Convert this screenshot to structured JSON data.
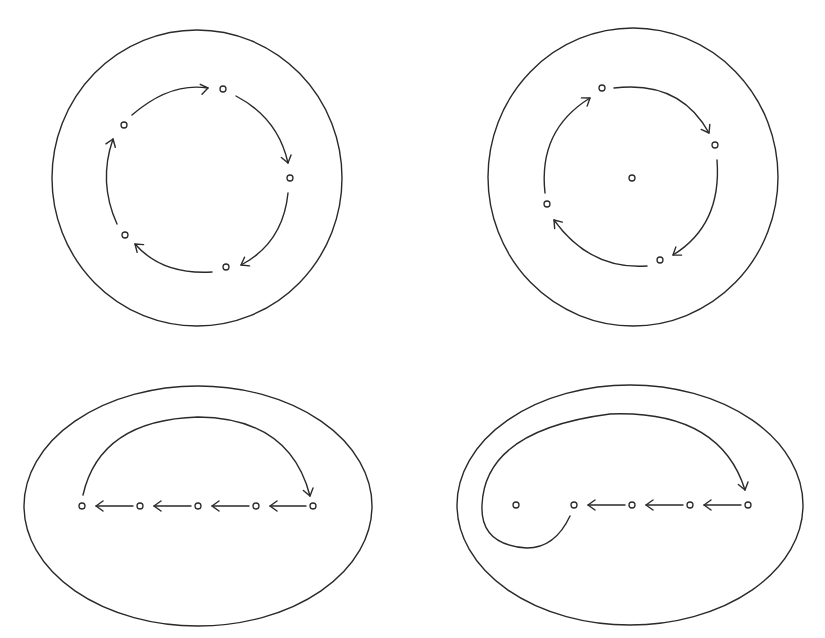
{
  "diagram": {
    "stroke_color": "#2a2a2a",
    "background": "#ffffff",
    "panels": [
      {
        "id": "top-left",
        "boundary": {
          "shape": "circle",
          "cx": 197,
          "cy": 178,
          "rx": 145,
          "ry": 148
        },
        "points": [
          [
            223,
            89
          ],
          [
            290,
            178
          ],
          [
            226,
            267
          ],
          [
            125,
            235
          ],
          [
            124,
            125
          ]
        ],
        "orbit": "periodic 5-cycle, clockwise",
        "arrows": [
          {
            "d": "M132 115 Q170 82 208 88",
            "head": [
              208,
              88,
              -10
            ]
          },
          {
            "d": "M236 96 Q278 118 288 163",
            "head": [
              288,
              163,
              75
            ]
          },
          {
            "d": "M288 193 Q283 243 241 265",
            "head": [
              241,
              265,
              150
            ]
          },
          {
            "d": "M212 272 Q162 275 135 244",
            "head": [
              135,
              244,
              220
            ]
          },
          {
            "d": "M117 224 Q98 182 113 139",
            "head": [
              113,
              139,
              -70
            ]
          }
        ]
      },
      {
        "id": "top-right",
        "boundary": {
          "shape": "circle",
          "cx": 633,
          "cy": 177,
          "rx": 145,
          "ry": 149
        },
        "points": [
          [
            602,
            88
          ],
          [
            715,
            145
          ],
          [
            660,
            260
          ],
          [
            547,
            204
          ],
          [
            632,
            178
          ]
        ],
        "orbit": "periodic 4-cycle around a fixed center point",
        "arrows": [
          {
            "d": "M614 88 Q680 80 709 133",
            "head": [
              709,
              133,
              60
            ]
          },
          {
            "d": "M717 160 Q722 225 673 255",
            "head": [
              673,
              255,
              145
            ]
          },
          {
            "d": "M647 266 Q590 270 554 220",
            "head": [
              554,
              220,
              230
            ]
          },
          {
            "d": "M545 193 Q538 130 590 98",
            "head": [
              590,
              98,
              -35
            ]
          }
        ]
      },
      {
        "id": "bottom-left",
        "boundary": {
          "shape": "ellipse",
          "cx": 198,
          "cy": 506,
          "rx": 174,
          "ry": 120
        },
        "points": [
          [
            82,
            506
          ],
          [
            140,
            506
          ],
          [
            198,
            506
          ],
          [
            256,
            506
          ],
          [
            313,
            506
          ]
        ],
        "orbit": "points marching left, then jumping back right",
        "arrows": [
          {
            "d": "M133 506 L96 506",
            "head": [
              96,
              506,
              180
            ]
          },
          {
            "d": "M191 506 L154 506",
            "head": [
              154,
              506,
              180
            ]
          },
          {
            "d": "M249 506 L212 506",
            "head": [
              212,
              506,
              180
            ]
          },
          {
            "d": "M306 506 L270 506",
            "head": [
              270,
              506,
              180
            ]
          },
          {
            "d": "M83 495 Q100 420 198 417 Q290 418 310 496",
            "head": [
              310,
              496,
              75
            ]
          }
        ]
      },
      {
        "id": "bottom-right",
        "boundary": {
          "shape": "ellipse",
          "cx": 630,
          "cy": 505,
          "rx": 173,
          "ry": 120
        },
        "points": [
          [
            516,
            505
          ],
          [
            574,
            505
          ],
          [
            632,
            505
          ],
          [
            690,
            505
          ],
          [
            748,
            505
          ]
        ],
        "orbit": "points marching left, curve wraps around isolated point",
        "arrows": [
          {
            "d": "M625 505 L588 505",
            "head": [
              588,
              505,
              180
            ]
          },
          {
            "d": "M683 505 L646 505",
            "head": [
              646,
              505,
              180
            ]
          },
          {
            "d": "M741 505 L704 505",
            "head": [
              704,
              505,
              180
            ]
          },
          {
            "d": "M570 516 Q555 548 527 548 Q480 545 482 505 Q485 430 610 414 Q720 410 745 490",
            "head": [
              745,
              490,
              75
            ]
          }
        ]
      }
    ]
  }
}
